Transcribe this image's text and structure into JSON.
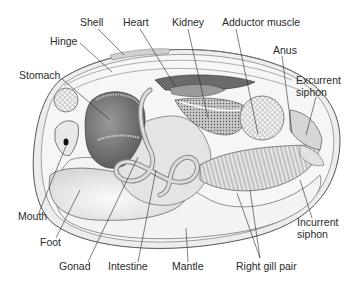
{
  "labels": {
    "shell": "Shell",
    "heart": "Heart",
    "kidney": "Kidney",
    "adductor_muscle": "Adductor muscle",
    "hinge": "Hinge",
    "anus": "Anus",
    "excurrent_line1": "Excurrent",
    "excurrent_line2": "siphon",
    "stomach": "Stomach",
    "mouth": "Mouth",
    "foot": "Foot",
    "incurrent_line1": "Incurrent",
    "incurrent_line2": "siphon",
    "gonad": "Gonad",
    "intestine": "Intestine",
    "mantle": "Mantle",
    "right_gill_pair": "Right gill pair"
  },
  "colors": {
    "ink": "#2a2a2a",
    "shell_fill": "#e9e9e9",
    "body_fill": "#f2f2f2",
    "dark_organ": "#7a7a7a",
    "mid_organ": "#b5b5b5",
    "light_organ": "#dcdcdc"
  }
}
